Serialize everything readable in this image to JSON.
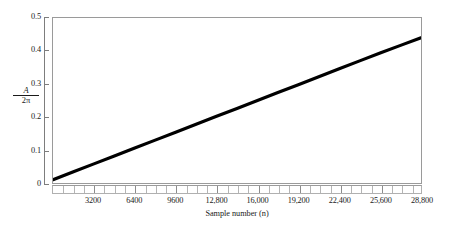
{
  "chart_data": {
    "type": "line",
    "title": "",
    "subtitle": "",
    "xlabel": "Sample number (n)",
    "ylabel": "A/2π",
    "ylabel_numerator": "A",
    "ylabel_denominator": "2π",
    "xlim": [
      0,
      28800
    ],
    "ylim": [
      0,
      0.5
    ],
    "grid": false,
    "legend": "none",
    "line_color": "#000000",
    "frame_color": "#9a9a9a",
    "background_color": "#ffffff",
    "x_tick_labels": [
      "3200",
      "6400",
      "9600",
      "12,800",
      "16,000",
      "19,200",
      "22,400",
      "25,600",
      "28,800"
    ],
    "x_tick_values": [
      3200,
      6400,
      9600,
      12800,
      16000,
      19200,
      22400,
      25600,
      28800
    ],
    "x_minor_tick_interval": 800,
    "y_tick_labels": [
      "0",
      "0.1",
      "0.2",
      "0.3",
      "0.4",
      "0.5"
    ],
    "y_tick_values": [
      0,
      0.1,
      0.2,
      0.3,
      0.4,
      0.5
    ],
    "series": [
      {
        "name": "A/2π vs sample number",
        "x": [
          0,
          1600,
          3200,
          4800,
          6400,
          8000,
          9600,
          11200,
          12800,
          14400,
          16000,
          17600,
          19200,
          20800,
          22400,
          24000,
          25600,
          27200,
          28800
        ],
        "values": [
          0.01,
          0.034,
          0.058,
          0.082,
          0.106,
          0.13,
          0.154,
          0.178,
          0.202,
          0.226,
          0.25,
          0.274,
          0.298,
          0.322,
          0.346,
          0.37,
          0.394,
          0.417,
          0.44
        ]
      }
    ],
    "slope_per_sample": 1.493e-05,
    "intercept": 0.01
  }
}
